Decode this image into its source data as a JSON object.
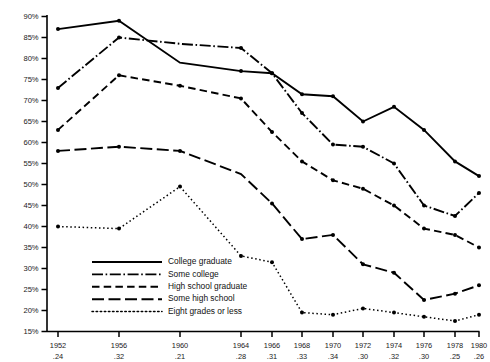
{
  "chart_data": {
    "type": "line",
    "title": "",
    "xlabel": "",
    "ylabel": "",
    "ylim": [
      15,
      90
    ],
    "ytick_step": 5,
    "grid": false,
    "legend_position": "inside-lower-left",
    "categories": [
      "1952",
      "1956",
      "1960",
      "1964",
      "1966",
      "1968",
      "1970",
      "1972",
      "1974",
      "1976",
      "1978",
      "1980"
    ],
    "x_sublabels": [
      ".24",
      ".32",
      ".21",
      ".28",
      ".31",
      ".33",
      ".34",
      ".30",
      ".32",
      ".30",
      ".25",
      ".26"
    ],
    "ytick_labels": [
      "90%",
      "85%",
      "80%",
      "75%",
      "70%",
      "65%",
      "60%",
      "55%",
      "50%",
      "45%",
      "40%",
      "35%",
      "30%",
      "25%",
      "20%",
      "15%"
    ],
    "ytick_values": [
      90,
      85,
      80,
      75,
      70,
      65,
      60,
      55,
      50,
      45,
      40,
      35,
      30,
      25,
      20,
      15
    ],
    "series": [
      {
        "name": "College graduate",
        "style": "solid",
        "values": [
          87.0,
          89.0,
          79.0,
          77.0,
          76.5,
          71.5,
          71.0,
          65.0,
          68.5,
          63.0,
          55.5,
          52.0
        ]
      },
      {
        "name": "Some college",
        "style": "dash-dot",
        "values": [
          73.0,
          85.0,
          83.5,
          82.5,
          76.5,
          67.0,
          59.5,
          59.0,
          55.0,
          45.0,
          42.5,
          48.0
        ]
      },
      {
        "name": "High school graduate",
        "style": "dashed",
        "values": [
          63.0,
          76.0,
          73.5,
          70.5,
          62.5,
          55.5,
          51.0,
          49.0,
          45.0,
          39.5,
          38.0,
          35.0
        ]
      },
      {
        "name": "Some high school",
        "style": "long-dash",
        "values": [
          58.0,
          59.0,
          58.0,
          52.5,
          45.5,
          37.0,
          38.0,
          31.0,
          29.0,
          22.5,
          24.0,
          26.0
        ]
      },
      {
        "name": "Eight grades or less",
        "style": "dotted",
        "values": [
          40.0,
          39.5,
          49.5,
          33.0,
          31.5,
          19.5,
          19.0,
          20.5,
          19.5,
          18.5,
          17.5,
          19.0
        ]
      }
    ]
  },
  "legend": {
    "items": [
      {
        "label": "College graduate",
        "style": "solid"
      },
      {
        "label": "Some college",
        "style": "dash-dot"
      },
      {
        "label": "High school graduate",
        "style": "dashed"
      },
      {
        "label": "Some high school",
        "style": "long-dash"
      },
      {
        "label": "Eight grades or less",
        "style": "dotted"
      }
    ]
  },
  "colors": {
    "ink": "#000000",
    "background": "#ffffff",
    "label": "#1a1a1a"
  }
}
